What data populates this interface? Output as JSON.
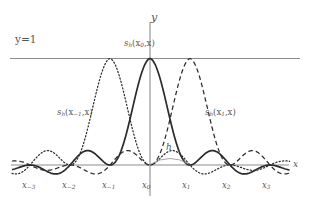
{
  "figure": {
    "title_y_axis": "y",
    "title_x_axis": "x",
    "gridline_label": "y=1",
    "spacing_label": "h",
    "background_color": "#ffffff",
    "axis_color": "#8c8c8c",
    "curve_color": "#2b2b2b",
    "text_color": "#565656"
  },
  "curve_labels": {
    "center": "s",
    "center_sub": "h",
    "center_arg": "(x",
    "center_arg_sub": "0",
    "center_arg_tail": ",x)",
    "left": "s",
    "left_sub": "h",
    "left_arg": "(x",
    "left_arg_sub": "−1",
    "left_arg_tail": ",x)",
    "right": "s",
    "right_sub": "h",
    "right_arg": "(x",
    "right_arg_sub": "1",
    "right_arg_tail": ",x)"
  },
  "node_labels": [
    {
      "base": "x",
      "sub": "−3"
    },
    {
      "base": "x",
      "sub": "−2"
    },
    {
      "base": "x",
      "sub": "−1"
    },
    {
      "base": "x",
      "sub": "0"
    },
    {
      "base": "x",
      "sub": "1"
    },
    {
      "base": "x",
      "sub": "2"
    },
    {
      "base": "x",
      "sub": "3"
    }
  ],
  "chart_data": {
    "type": "line",
    "title": "",
    "xlabel": "x",
    "ylabel": "y",
    "grid": false,
    "legend_position": "inline-annotations",
    "node_spacing_h": 1,
    "nodes_x": [
      -3,
      -2,
      -1,
      0,
      1,
      2,
      3
    ],
    "xlim": [
      -3.45,
      3.5
    ],
    "ylim": [
      -0.3,
      1.25
    ],
    "reference_lines": [
      {
        "label": "y=1",
        "y": 1,
        "orientation": "horizontal"
      }
    ],
    "series": [
      {
        "name": "s_h(x_0,x)",
        "style": "solid",
        "center_node": 0,
        "x": [
          -3.4,
          -3.2,
          -3.0,
          -2.8,
          -2.6,
          -2.5,
          -2.4,
          -2.2,
          -2.0,
          -1.8,
          -1.6,
          -1.5,
          -1.4,
          -1.2,
          -1.0,
          -0.8,
          -0.6,
          -0.5,
          -0.4,
          -0.2,
          0.0,
          0.2,
          0.4,
          0.5,
          0.6,
          0.8,
          1.0,
          1.2,
          1.4,
          1.5,
          1.6,
          1.8,
          2.0,
          2.2,
          2.4,
          2.5,
          2.6,
          2.8,
          3.0,
          3.2,
          3.4
        ],
        "y": [
          -0.093,
          0.062,
          0.0,
          -0.072,
          0.098,
          0.127,
          0.116,
          -0.0,
          -0.138,
          -0.223,
          0.0,
          0.212,
          0.189,
          -0.0,
          -0.3,
          -0.379,
          0.505,
          0.637,
          0.757,
          0.935,
          1.0,
          0.935,
          0.757,
          0.637,
          0.505,
          -0.379,
          -0.3,
          -0.0,
          0.189,
          0.212,
          0.0,
          -0.223,
          -0.138,
          -0.0,
          0.116,
          0.127,
          0.098,
          -0.072,
          0.0,
          0.062,
          -0.093
        ]
      },
      {
        "name": "s_h(x_-1,x)",
        "style": "dotted",
        "center_node": -1,
        "x": [
          -3.4,
          -3.2,
          -3.0,
          -2.8,
          -2.6,
          -2.5,
          -2.4,
          -2.2,
          -2.0,
          -1.8,
          -1.6,
          -1.5,
          -1.4,
          -1.2,
          -1.0,
          -0.8,
          -0.6,
          -0.5,
          -0.4,
          -0.2,
          0.0,
          0.2,
          0.4,
          0.5,
          0.6,
          0.8,
          1.0,
          1.2,
          1.4,
          1.5,
          1.6,
          1.8,
          2.0,
          2.2,
          2.4,
          2.5,
          2.6,
          2.8,
          3.0,
          3.2,
          3.4
        ],
        "y": [
          0.062,
          0.0,
          -0.072,
          0.098,
          0.127,
          0.116,
          -0.0,
          -0.138,
          -0.223,
          0.0,
          0.505,
          0.637,
          0.757,
          0.935,
          1.0,
          0.935,
          0.757,
          0.637,
          0.505,
          -0.379,
          -0.3,
          -0.0,
          0.189,
          0.212,
          0.0,
          -0.223,
          -0.138,
          -0.0,
          0.116,
          0.127,
          0.098,
          -0.072,
          0.0,
          0.062,
          -0.093,
          -0.1,
          -0.093,
          0.045,
          0.0,
          -0.052,
          0.08
        ]
      },
      {
        "name": "s_h(x_1,x)",
        "style": "dashed",
        "center_node": 1,
        "x": [
          -3.4,
          -3.2,
          -3.0,
          -2.8,
          -2.6,
          -2.5,
          -2.4,
          -2.2,
          -2.0,
          -1.8,
          -1.6,
          -1.5,
          -1.4,
          -1.2,
          -1.0,
          -0.8,
          -0.6,
          -0.5,
          -0.4,
          -0.2,
          0.0,
          0.2,
          0.4,
          0.5,
          0.6,
          0.8,
          1.0,
          1.2,
          1.4,
          1.5,
          1.6,
          1.8,
          2.0,
          2.2,
          2.4,
          2.5,
          2.6,
          2.8,
          3.0,
          3.2,
          3.4
        ],
        "y": [
          0.08,
          -0.052,
          0.0,
          0.045,
          -0.093,
          -0.1,
          -0.093,
          0.062,
          0.0,
          -0.072,
          0.098,
          0.127,
          0.116,
          -0.0,
          -0.138,
          -0.223,
          0.0,
          0.212,
          0.189,
          -0.0,
          -0.3,
          -0.379,
          0.505,
          0.637,
          0.757,
          0.935,
          1.0,
          0.935,
          0.757,
          0.637,
          0.505,
          -0.379,
          -0.3,
          -0.0,
          0.189,
          0.212,
          0.0,
          -0.223,
          -0.138,
          -0.0,
          0.116
        ]
      }
    ]
  }
}
